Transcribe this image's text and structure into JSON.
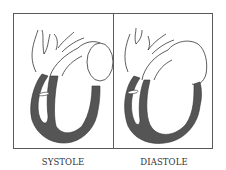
{
  "figure": {
    "panels": [
      {
        "id": "systole",
        "label": "SYSTOLE"
      },
      {
        "id": "diastole",
        "label": "DIASTOLE"
      }
    ],
    "colors": {
      "background": "#ffffff",
      "frame": "#5a5a5a",
      "myocardium": "#555555",
      "outline": "#333333"
    }
  }
}
